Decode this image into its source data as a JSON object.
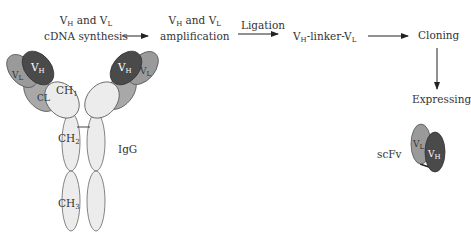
{
  "steps": {
    "cdna": {
      "line1_v1": "V",
      "line1_h": "H",
      "line1_and": " and V",
      "line1_l": "L",
      "line2": "cDNA synthesis"
    },
    "amplification": {
      "line1_v1": "V",
      "line1_h": "H",
      "line1_and": " and V",
      "line1_l": "L",
      "line2": "amplification"
    },
    "ligation": {
      "label": "Ligation"
    },
    "linker": {
      "v1": "V",
      "h": "H",
      "mid": "-linker-V",
      "l": "L"
    },
    "cloning": {
      "label": "Cloning"
    },
    "expressing": {
      "label": "Expressing"
    }
  },
  "igg": {
    "label": "IgG",
    "domains": {
      "vh": "V",
      "vh_sub": "H",
      "vl": "V",
      "vl_sub": "L",
      "cl": "CL",
      "ch1": "CH",
      "ch1_sub": "1",
      "ch2": "CH",
      "ch2_sub": "2",
      "ch3": "CH",
      "ch3_sub": "3"
    }
  },
  "scfv": {
    "label": "scFv",
    "vl": "V",
    "vl_sub": "L",
    "vh": "V",
    "vh_sub": "H"
  },
  "colors": {
    "vh_dark": "#4a4a4a",
    "vl_mid": "#9a9a9a",
    "cl_mid": "#a8a8a8",
    "constant_light": "#ececec",
    "outline": "#555555"
  }
}
